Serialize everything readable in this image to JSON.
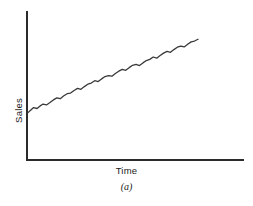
{
  "figure": {
    "caption": "(a)",
    "background_color": "#ffffff",
    "axis_color": "#2b2b2b",
    "line_color": "#3a3a3a"
  },
  "chart_data": {
    "type": "line",
    "title": "",
    "subtitle": "",
    "xlabel": "Time",
    "ylabel": "Sales",
    "caption": "(a)",
    "grid": false,
    "legend": false,
    "legend_position": "none",
    "axis_ticks": false,
    "tick_labels_x": [],
    "tick_labels_y": [],
    "xlim": [
      0,
      100
    ],
    "ylim": [
      0,
      100
    ],
    "series": [
      {
        "name": "Sales",
        "color": "#3a3a3a",
        "x": [
          0,
          1.2,
          2.6,
          4.2,
          5.5,
          7.0,
          8.6,
          10.2,
          11.8,
          13.4,
          15.0,
          16.5,
          18.2,
          19.8,
          21.4,
          23.0,
          24.6,
          26.2,
          27.8,
          29.4,
          31.0,
          32.6,
          34.2,
          35.8,
          37.4,
          39.0,
          40.6,
          42.2,
          43.8,
          45.4,
          47.0,
          48.6,
          50.2,
          51.8,
          53.4,
          55.0,
          56.6,
          58.2,
          59.8,
          61.4,
          63.0,
          64.6,
          66.2,
          67.8,
          69.4,
          71.0,
          72.6,
          74.2,
          75.8,
          77.4,
          79.0
        ],
        "y": [
          32.0,
          33.6,
          35.4,
          34.8,
          36.4,
          37.8,
          37.2,
          38.8,
          40.6,
          42.0,
          41.4,
          43.2,
          44.8,
          45.2,
          47.0,
          48.4,
          47.8,
          49.6,
          51.2,
          52.0,
          53.6,
          53.0,
          54.8,
          56.4,
          57.0,
          56.6,
          58.4,
          60.0,
          61.2,
          60.6,
          62.4,
          64.0,
          64.6,
          63.8,
          65.6,
          67.2,
          68.0,
          69.6,
          68.8,
          70.6,
          72.2,
          73.4,
          72.8,
          74.6,
          76.2,
          77.0,
          76.4,
          78.2,
          79.8,
          80.4,
          81.6
        ]
      }
    ]
  }
}
